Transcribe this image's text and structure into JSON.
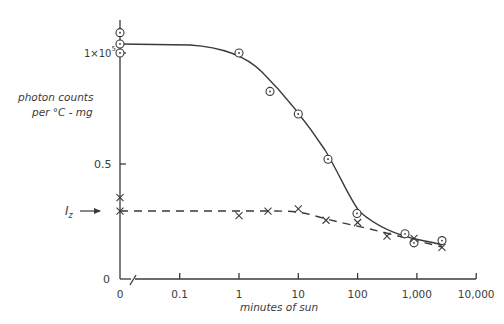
{
  "chart_data": {
    "type": "scatter",
    "title": "",
    "xlabel": "minutes of sun",
    "ylabel_line1": "photon counts",
    "ylabel_line2": "per °C - mg",
    "x_scale": "log (with broken axis at 0)",
    "x_ticks": [
      "0",
      "0.1",
      "1",
      "10",
      "100",
      "1,000",
      "10,000"
    ],
    "y_ticks": [
      {
        "label": "0",
        "value": 0
      },
      {
        "label": "0.5",
        "value": 0.5
      },
      {
        "label": "1×10",
        "sup": "5",
        "value": 1.0
      }
    ],
    "y_units": "×10^5 photon counts per °C-mg",
    "ylim": [
      0,
      1.1
    ],
    "annotation": {
      "label": "I",
      "sub": "z",
      "value": 0.3,
      "arrow": true
    },
    "series": [
      {
        "name": "circles (solid curve)",
        "marker": "circle-dot",
        "line": "solid",
        "points": [
          {
            "x": 0,
            "y": 1.09
          },
          {
            "x": 0,
            "y": 1.04
          },
          {
            "x": 0,
            "y": 1.0
          },
          {
            "x": 1,
            "y": 1.0
          },
          {
            "x": 3,
            "y": 0.83
          },
          {
            "x": 10,
            "y": 0.73
          },
          {
            "x": 30,
            "y": 0.53
          },
          {
            "x": 110,
            "y": 0.29
          },
          {
            "x": 700,
            "y": 0.2
          },
          {
            "x": 1000,
            "y": 0.16
          },
          {
            "x": 2700,
            "y": 0.17
          }
        ]
      },
      {
        "name": "crosses (dashed curve)",
        "marker": "x",
        "line": "dashed",
        "points": [
          {
            "x": 0,
            "y": 0.36
          },
          {
            "x": 0,
            "y": 0.3
          },
          {
            "x": 1,
            "y": 0.28
          },
          {
            "x": 3,
            "y": 0.3
          },
          {
            "x": 10,
            "y": 0.31
          },
          {
            "x": 30,
            "y": 0.26
          },
          {
            "x": 100,
            "y": 0.25
          },
          {
            "x": 330,
            "y": 0.19
          },
          {
            "x": 1000,
            "y": 0.18
          },
          {
            "x": 2700,
            "y": 0.14
          }
        ]
      }
    ],
    "grid": false,
    "legend": "none"
  }
}
